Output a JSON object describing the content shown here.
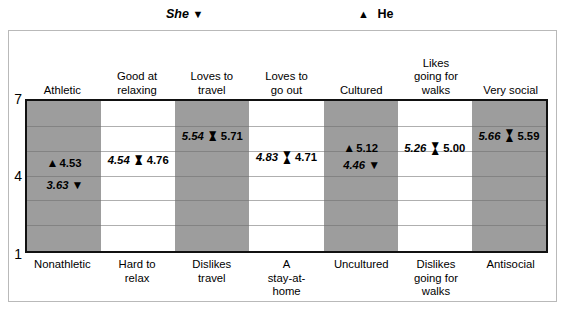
{
  "legend": {
    "she": {
      "label": "She",
      "glyph": "▼",
      "glyph_name": "triangle-down-icon"
    },
    "he": {
      "label": "He",
      "glyph": "▲",
      "glyph_name": "triangle-up-icon"
    }
  },
  "axis": {
    "y_top": "7",
    "y_mid": "4",
    "y_bottom": "1"
  },
  "chart_data": {
    "type": "scatter",
    "title": "",
    "xlabel": "",
    "ylabel": "",
    "ylim": [
      1,
      7
    ],
    "yticks": [
      1,
      4,
      7
    ],
    "grid": true,
    "legend_position": "top",
    "categories": [
      "Athletic",
      "Good at relaxing",
      "Loves to travel",
      "Loves to go out",
      "Cultured",
      "Likes going for walks",
      "Very social"
    ],
    "categories_low": [
      "Nonathletic",
      "Hard to relax",
      "Dislikes travel",
      "A stay-at-home",
      "Uncultured",
      "Dislikes going for walks",
      "Antisocial"
    ],
    "series": [
      {
        "name": "She",
        "values": [
          3.63,
          4.54,
          5.54,
          4.83,
          4.46,
          5.26,
          5.66
        ]
      },
      {
        "name": "He",
        "values": [
          4.53,
          4.76,
          5.71,
          4.71,
          5.12,
          5.0,
          5.59
        ]
      }
    ]
  },
  "top_labels": [
    {
      "line1": "Athletic",
      "line2": ""
    },
    {
      "line1": "Good at",
      "line2": "relaxing"
    },
    {
      "line1": "Loves to",
      "line2": "travel"
    },
    {
      "line1": "Loves to",
      "line2": "go out"
    },
    {
      "line1": "Cultured",
      "line2": ""
    },
    {
      "line1": "Likes",
      "line2": "going for",
      "line3": "walks"
    },
    {
      "line1": "Very social",
      "line2": ""
    }
  ],
  "bottom_labels": [
    {
      "line1": "Nonathletic",
      "line2": "",
      "line3": ""
    },
    {
      "line1": "Hard to",
      "line2": "relax",
      "line3": ""
    },
    {
      "line1": "Dislikes",
      "line2": "travel",
      "line3": ""
    },
    {
      "line1": "A",
      "line2": "stay-at-",
      "line3": "home"
    },
    {
      "line1": "Uncultured",
      "line2": "",
      "line3": ""
    },
    {
      "line1": "Dislikes",
      "line2": "going for",
      "line3": "walks"
    },
    {
      "line1": "Antisocial",
      "line2": "",
      "line3": ""
    }
  ],
  "points": [
    {
      "category": "Athletic",
      "layout": "split",
      "he": {
        "value": "4.53",
        "glyph": "▲"
      },
      "she": {
        "value": "3.63",
        "glyph": "▼"
      }
    },
    {
      "category": "Good at relaxing",
      "layout": "merged-diamond",
      "she": {
        "value": "4.54"
      },
      "he": {
        "value": "4.76"
      }
    },
    {
      "category": "Loves to travel",
      "layout": "merged-diamond",
      "she": {
        "value": "5.54"
      },
      "he": {
        "value": "5.71"
      }
    },
    {
      "category": "Loves to go out",
      "layout": "merged-hourglass",
      "she": {
        "value": "4.83"
      },
      "he": {
        "value": "4.71"
      }
    },
    {
      "category": "Cultured",
      "layout": "split",
      "he": {
        "value": "5.12",
        "glyph": "▲"
      },
      "she": {
        "value": "4.46",
        "glyph": "▼"
      }
    },
    {
      "category": "Likes going for walks",
      "layout": "merged-hourglass",
      "she": {
        "value": "5.26"
      },
      "he": {
        "value": "5.00"
      }
    },
    {
      "category": "Very social",
      "layout": "merged-hourglass",
      "she": {
        "value": "5.66"
      },
      "he": {
        "value": "5.59"
      }
    }
  ],
  "colors": {
    "shaded_column": "#9d9d9d",
    "plot_border": "#111111",
    "gridline": "#6e6e6e",
    "card_border": "#b9b9b9",
    "text": "#000000"
  }
}
